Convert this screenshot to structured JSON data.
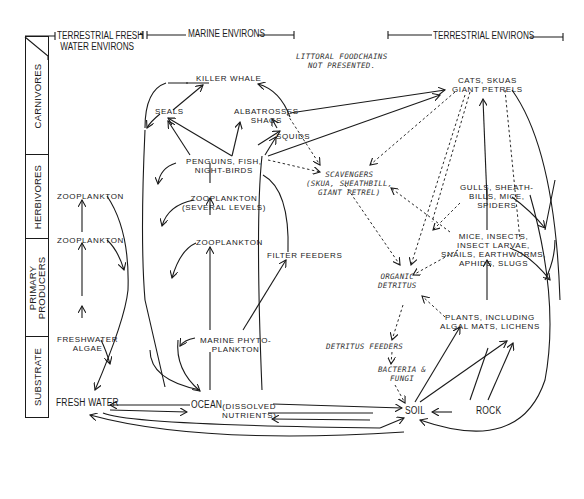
{
  "headers": {
    "terrestrial_fresh_line1": "TERRESTRIAL FRESH",
    "terrestrial_fresh_line2": "WATER ENVIRONS",
    "marine": "MARINE ENVIRONS",
    "terrestrial": "TERRESTRIAL ENVIRONS"
  },
  "note": {
    "line1": "LITTORAL FOODCHAINS",
    "line2": "NOT PRESENTED."
  },
  "trophic_levels": [
    {
      "label_line1": "CARNIVORES",
      "label_line2": ""
    },
    {
      "label_line1": "HERBIVORES",
      "label_line2": ""
    },
    {
      "label_line1": "PRIMARY",
      "label_line2": "PRODUCERS"
    },
    {
      "label_line1": "SUBSTRATE",
      "label_line2": ""
    }
  ],
  "nodes": {
    "fw_zoo_top": "ZOOPLANKTON",
    "fw_zoo_mid": "ZOOPLANKTON",
    "fw_algae_1": "FRESHWATER",
    "fw_algae_2": "ALGAE",
    "fresh_water": "FRESH WATER",
    "killer_whale": "KILLER WHALE",
    "seals": "SEALS",
    "albatrosses_1": "ALBATROSSES",
    "albatrosses_2": "SHAGS",
    "squids": "SQUIDS",
    "penguins_1": "PENGUINS, FISH,",
    "penguins_2": "NIGHT-BIRDS",
    "zoo_several_1": "ZOOPLANKTON",
    "zoo_several_2": "(SEVERAL LEVELS)",
    "marine_zoo": "ZOOPLANKTON",
    "filter_feeders": "FILTER FEEDERS",
    "phyto_1": "MARINE PHYTO-",
    "phyto_2": "PLANKTON",
    "ocean": "OCEAN",
    "dissolved_1": "(DISSOLVED",
    "dissolved_2": "NUTRIENTS)",
    "scavengers_1": "SCAVENGERS",
    "scavengers_2": "(SKUA, SHEATHBILL,",
    "scavengers_3": "GIANT PETREL)",
    "organic_1": "ORGANIC",
    "organic_2": "DETRITUS",
    "detritus_feeders": "DETRITUS FEEDERS",
    "bacteria_1": "BACTERIA &",
    "bacteria_2": "FUNGI",
    "cats_1": "CATS, SKUAS",
    "cats_2": "GIANT PETRELS",
    "gulls_1": "GULLS, SHEATH-",
    "gulls_2": "BILLS, MICE,",
    "gulls_3": "SPIDERS",
    "mice_1": "MICE, INSECTS,",
    "mice_2": "INSECT LARVAE,",
    "mice_3": "SNAILS, EARTHWORMS,",
    "mice_4": "APHIDS, SLUGS",
    "plants_1": "PLANTS, INCLUDING",
    "plants_2": "ALGAL MATS, LICHENS",
    "soil": "SOIL",
    "rock": "ROCK"
  },
  "colors": {
    "ink": "#1a1a1a",
    "background": "#ffffff",
    "dashed_ink": "#2a2a2a"
  }
}
